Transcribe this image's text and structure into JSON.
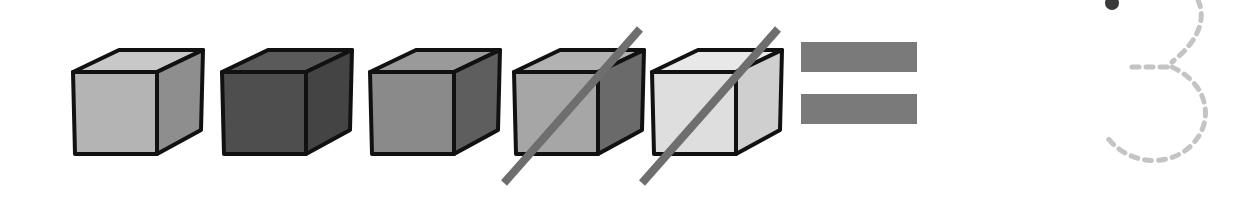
{
  "worksheet": {
    "title": "Counting subtraction with cubes",
    "cubes": [
      {
        "id": "cube-1",
        "front": "#b4b4b4",
        "top": "#c8c8c8",
        "side": "#8e8e8e",
        "crossed_out": false
      },
      {
        "id": "cube-2",
        "front": "#4e4e4e",
        "top": "#5a5a5a",
        "side": "#444444",
        "crossed_out": false
      },
      {
        "id": "cube-3",
        "front": "#8a8a8a",
        "top": "#9a9a9a",
        "side": "#5e5e5e",
        "crossed_out": false
      },
      {
        "id": "cube-4",
        "front": "#a6a6a6",
        "top": "#b2b2b2",
        "side": "#6a6a6a",
        "crossed_out": true
      },
      {
        "id": "cube-5",
        "front": "#dedede",
        "top": "#e8e8e8",
        "side": "#cfcfcf",
        "crossed_out": true
      }
    ],
    "total_cubes": 5,
    "crossed_out_count": 2,
    "equals_sign_color": "#7a7a7a",
    "strike_color": "#6e6e6e",
    "answer_digit": "3",
    "answer_style": "dashed-tracing",
    "trace_color": "#c4c4c4",
    "start_dot_color": "#3a3a3a"
  }
}
